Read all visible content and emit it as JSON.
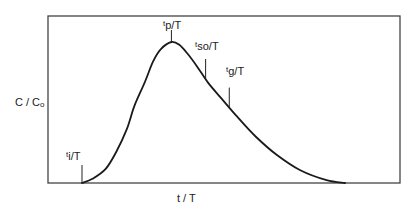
{
  "chart_data": {
    "type": "line",
    "title": "",
    "xlabel": "t / T",
    "ylabel": "C / Co",
    "ylabel_parts": {
      "main": "C / C",
      "sub": "o"
    },
    "grid": false,
    "legend": null,
    "axis_ticks": "none",
    "series": [
      {
        "name": "C/Co",
        "x_norm": [
          0.0,
          0.04,
          0.09,
          0.13,
          0.17,
          0.2,
          0.24,
          0.27,
          0.3,
          0.34,
          0.37,
          0.4,
          0.44,
          0.48,
          0.53,
          0.59,
          0.66,
          0.74,
          0.83,
          0.93,
          1.0
        ],
        "y_norm": [
          0.0,
          0.03,
          0.1,
          0.22,
          0.38,
          0.55,
          0.72,
          0.86,
          0.95,
          1.0,
          0.98,
          0.92,
          0.82,
          0.71,
          0.6,
          0.47,
          0.33,
          0.2,
          0.09,
          0.02,
          0.0
        ]
      }
    ],
    "annotations": [
      {
        "id": "ti",
        "label_main": "t",
        "label_sub": "i",
        "label_den": "/T",
        "x_norm": 0.0,
        "meaning": "initial breakthrough time"
      },
      {
        "id": "tp",
        "label_main": "t",
        "label_sub": "p",
        "label_den": "/T",
        "x_norm": 0.34,
        "meaning": "peak time"
      },
      {
        "id": "tso",
        "label_main": "t",
        "label_sub": "so",
        "label_den": "/T",
        "x_norm": 0.47,
        "meaning": ""
      },
      {
        "id": "tg",
        "label_main": "t",
        "label_sub": "g",
        "label_den": "/T",
        "x_norm": 0.56,
        "meaning": ""
      }
    ]
  },
  "labels": {
    "xlabel": "t / T",
    "ylabel_main": "C / C",
    "ylabel_sub": "o",
    "ti_t": "t",
    "ti_sub": "i",
    "ti_den": "/T",
    "tp_t": "t",
    "tp_sub": "p",
    "tp_den": "/T",
    "tso_t": "t",
    "tso_sub": "so",
    "tso_den": "/T",
    "tg_t": "t",
    "tg_sub": "g",
    "tg_den": "/T"
  },
  "colors": {
    "line": "#1a1a1a",
    "frame": "#333333",
    "background": "#ffffff"
  }
}
